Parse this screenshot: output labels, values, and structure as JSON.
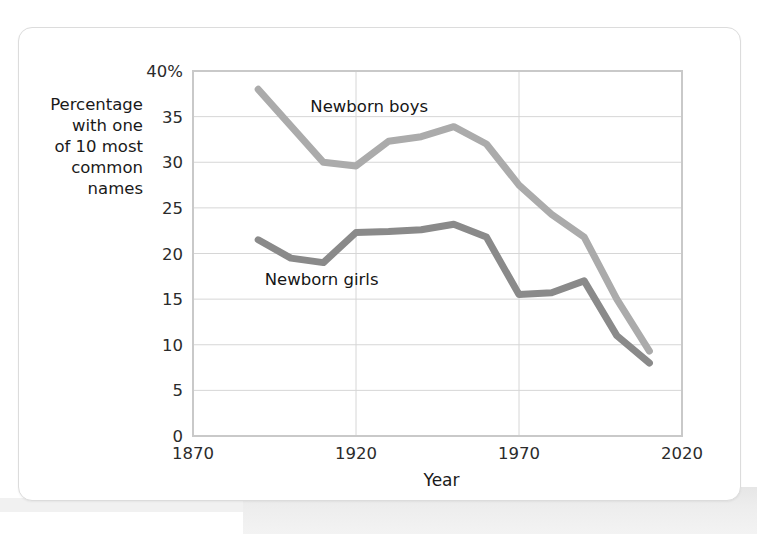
{
  "figure": {
    "y_axis_caption": "Percentage\nwith one\nof 10 most\ncommon\nnames",
    "x_axis_title": "Year",
    "boys_label": "Newborn boys",
    "girls_label": "Newborn girls",
    "boys_color": "#ababab",
    "girls_color": "#8a8a8a",
    "grid_color": "#d6d6d6",
    "axis_color": "#c9c9c9",
    "card_bg": "#ffffff",
    "text_color": "#1a1a1a"
  },
  "chart_data": {
    "type": "line",
    "title": "",
    "xlabel": "Year",
    "ylabel": "Percentage with one of 10 most common names",
    "xlim": [
      1870,
      2020
    ],
    "ylim": [
      0,
      40
    ],
    "xticks": [
      1870,
      1920,
      1970,
      2020
    ],
    "xtick_labels": [
      "1870",
      "1920",
      "1970",
      "2020"
    ],
    "yticks": [
      0,
      5,
      10,
      15,
      20,
      25,
      30,
      35,
      40
    ],
    "ytick_labels": [
      "0",
      "5",
      "10",
      "15",
      "20",
      "25",
      "30",
      "35",
      "40%"
    ],
    "grid": true,
    "legend": "inline-annotations",
    "series": [
      {
        "name": "Newborn boys",
        "color": "#ababab",
        "x": [
          1890,
          1900,
          1910,
          1920,
          1930,
          1940,
          1950,
          1960,
          1970,
          1980,
          1990,
          2000,
          2010
        ],
        "values": [
          38.0,
          34.0,
          30.0,
          29.6,
          32.3,
          32.8,
          33.9,
          32.0,
          27.5,
          24.3,
          21.8,
          15.0,
          9.3
        ]
      },
      {
        "name": "Newborn girls",
        "color": "#8a8a8a",
        "x": [
          1890,
          1900,
          1910,
          1920,
          1930,
          1940,
          1950,
          1960,
          1970,
          1980,
          1990,
          2000,
          2010
        ],
        "values": [
          21.5,
          19.5,
          19.0,
          22.3,
          22.4,
          22.6,
          23.2,
          21.8,
          15.5,
          15.7,
          17.0,
          11.0,
          8.0
        ]
      }
    ]
  }
}
